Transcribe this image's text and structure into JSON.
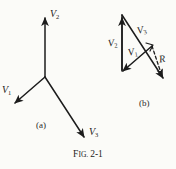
{
  "figure": {
    "caption_lead": "F",
    "caption_rest": "IG.",
    "caption_number": "2-1",
    "caption_full": "Fig. 2-1",
    "background_color": "#fbfbf8",
    "ink_color": "#1c1c1c"
  },
  "panel_a": {
    "id": "(a)",
    "label_text": "(a)",
    "origin": {
      "x": 45,
      "y": 77
    },
    "vectors": [
      {
        "name": "V2",
        "label_base": "V",
        "label_sub": "2",
        "x1": 45,
        "y1": 77,
        "x2": 45,
        "y2": 14,
        "style": "solid",
        "label_x": 50,
        "label_y": 10
      },
      {
        "name": "V1",
        "label_base": "V",
        "label_sub": "1",
        "x1": 45,
        "y1": 77,
        "x2": 12,
        "y2": 106,
        "style": "solid",
        "label_x": 2,
        "label_y": 86
      },
      {
        "name": "V3",
        "label_base": "V",
        "label_sub": "3",
        "x1": 45,
        "y1": 77,
        "x2": 86,
        "y2": 141,
        "style": "solid",
        "label_x": 89,
        "label_y": 128
      }
    ]
  },
  "panel_b": {
    "id": "(b)",
    "label_text": "(b)",
    "vectors": [
      {
        "name": "V2",
        "label_base": "V",
        "label_sub": "2",
        "x1": 122,
        "y1": 73,
        "x2": 122,
        "y2": 14,
        "style": "solid",
        "label_x": 110,
        "label_y": 40
      },
      {
        "name": "V3",
        "label_base": "V",
        "label_sub": "3",
        "x1": 122,
        "y1": 14,
        "x2": 166,
        "y2": 82,
        "style": "solid",
        "label_x": 138,
        "label_y": 26
      },
      {
        "name": "V1",
        "label_base": "V",
        "label_sub": "1",
        "x1": 152,
        "y1": 46,
        "x2": 120,
        "y2": 74,
        "style": "solid",
        "label_x": 129,
        "label_y": 48
      },
      {
        "name": "R",
        "label_base": "R",
        "label_sub": "",
        "x1": 152,
        "y1": 46,
        "x2": 164,
        "y2": 80,
        "style": "dashed",
        "label_x": 159,
        "label_y": 58
      }
    ],
    "label_x": 139,
    "label_y": 100
  }
}
